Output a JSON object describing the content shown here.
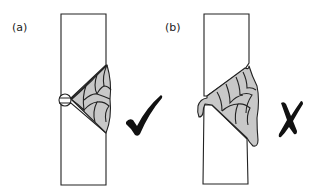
{
  "figure": {
    "panels": [
      {
        "id": "a",
        "label": "(a)",
        "description": "Correct multi-pass butt weld with backing",
        "verdict": "correct",
        "verdict_icon": "checkmark-icon"
      },
      {
        "id": "b",
        "label": "(b)",
        "description": "Incorrect weld with excess penetration and overlap",
        "verdict": "incorrect",
        "verdict_icon": "cross-icon"
      }
    ],
    "colors": {
      "weld_fill": "#c8c8c8",
      "outline": "#222222",
      "mark": "#111111"
    }
  }
}
